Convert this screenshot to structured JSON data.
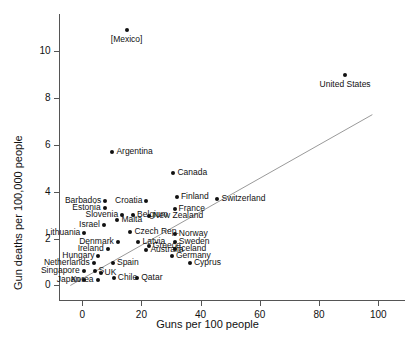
{
  "chart_data": {
    "type": "scatter",
    "title": "",
    "xlabel": "Guns per 100 people",
    "ylabel": "Gun deaths per 100,000 people",
    "xlim": [
      -8,
      107
    ],
    "ylim": [
      -0.6,
      11.6
    ],
    "xticks": [
      0,
      20,
      40,
      60,
      80,
      100
    ],
    "yticks": [
      0,
      2,
      4,
      6,
      8,
      10
    ],
    "grid": false,
    "legend": null,
    "trendline": {
      "x0": -4.0,
      "y0": 0.0,
      "x1": 98.0,
      "y1": 7.3
    },
    "points": [
      {
        "label": "[Mexico]",
        "x": 15.0,
        "y": 10.9,
        "pos": "below"
      },
      {
        "label": "United States",
        "x": 88.8,
        "y": 9.0,
        "pos": "below"
      },
      {
        "label": "Argentina",
        "x": 10.2,
        "y": 5.7,
        "pos": "right"
      },
      {
        "label": "Canada",
        "x": 30.8,
        "y": 4.8,
        "pos": "right"
      },
      {
        "label": "Finland",
        "x": 32.0,
        "y": 3.8,
        "pos": "right"
      },
      {
        "label": "Switzerland",
        "x": 45.7,
        "y": 3.7,
        "pos": "right"
      },
      {
        "label": "France",
        "x": 31.2,
        "y": 3.25,
        "pos": "right"
      },
      {
        "label": "New Zealand",
        "x": 22.6,
        "y": 2.95,
        "pos": "right"
      },
      {
        "label": "Barbados",
        "x": 7.8,
        "y": 3.6,
        "pos": "left"
      },
      {
        "label": "Croatia",
        "x": 21.7,
        "y": 3.6,
        "pos": "left"
      },
      {
        "label": "Estonia",
        "x": 7.6,
        "y": 3.3,
        "pos": "left"
      },
      {
        "label": "Slovenia",
        "x": 13.5,
        "y": 3.0,
        "pos": "left"
      },
      {
        "label": "Belgium",
        "x": 17.2,
        "y": 3.0,
        "pos": "right"
      },
      {
        "label": "Malta",
        "x": 11.9,
        "y": 2.8,
        "pos": "right"
      },
      {
        "label": "Israel",
        "x": 7.3,
        "y": 2.6,
        "pos": "left"
      },
      {
        "label": "Czech Rep.",
        "x": 16.3,
        "y": 2.3,
        "pos": "right"
      },
      {
        "label": "Lithuania",
        "x": 0.7,
        "y": 2.25,
        "pos": "left"
      },
      {
        "label": "Norway",
        "x": 31.3,
        "y": 2.2,
        "pos": "right"
      },
      {
        "label": "Denmark",
        "x": 12.0,
        "y": 1.85,
        "pos": "left"
      },
      {
        "label": "Latvia",
        "x": 19.0,
        "y": 1.85,
        "pos": "right"
      },
      {
        "label": "Sweden",
        "x": 31.3,
        "y": 1.85,
        "pos": "right"
      },
      {
        "label": "Greece",
        "x": 22.5,
        "y": 1.7,
        "pos": "right"
      },
      {
        "label": "Iceland",
        "x": 31.3,
        "y": 1.55,
        "pos": "right"
      },
      {
        "label": "Ireland",
        "x": 8.6,
        "y": 1.55,
        "pos": "left"
      },
      {
        "label": "Australia",
        "x": 21.7,
        "y": 1.5,
        "pos": "right"
      },
      {
        "label": "Germany",
        "x": 30.3,
        "y": 1.25,
        "pos": "right"
      },
      {
        "label": "Hungary",
        "x": 5.5,
        "y": 1.25,
        "pos": "left"
      },
      {
        "label": "Netherlands",
        "x": 3.9,
        "y": 0.95,
        "pos": "left"
      },
      {
        "label": "Spain",
        "x": 10.4,
        "y": 0.95,
        "pos": "right"
      },
      {
        "label": "Cyprus",
        "x": 36.4,
        "y": 0.95,
        "pos": "right"
      },
      {
        "label": "Singapore",
        "x": 0.5,
        "y": 0.6,
        "pos": "left"
      },
      {
        "label": "S",
        "x": 4.2,
        "y": 0.6,
        "pos": "right"
      },
      {
        "label": "UK",
        "x": 6.2,
        "y": 0.55,
        "pos": "right"
      },
      {
        "label": "Japan",
        "x": 0.6,
        "y": 0.25,
        "pos": "left"
      },
      {
        "label": "Korea",
        "x": 5.2,
        "y": 0.25,
        "pos": "left"
      },
      {
        "label": "Chile",
        "x": 10.7,
        "y": 0.3,
        "pos": "right"
      },
      {
        "label": "Qatar",
        "x": 18.6,
        "y": 0.3,
        "pos": "right"
      }
    ]
  }
}
